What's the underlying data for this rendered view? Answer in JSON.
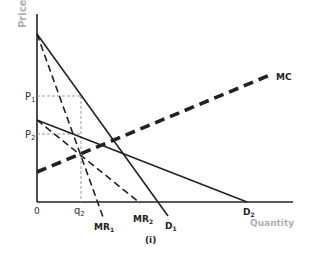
{
  "axes": {
    "y_label": "Price",
    "x_label": "Quantity",
    "origin": "0",
    "label_color": "#b0b0b0"
  },
  "ticks": {
    "p1": "P",
    "p1_sub": "1",
    "p2": "P",
    "p2_sub": "2",
    "q2": "q",
    "q2_sub": "2"
  },
  "curves": {
    "mc": "MC",
    "mr1": "MR",
    "mr1_sub": "1",
    "mr2": "MR",
    "mr2_sub": "2",
    "d1": "D",
    "d1_sub": "1",
    "d2": "D",
    "d2_sub": "2"
  },
  "caption": "(i)"
}
